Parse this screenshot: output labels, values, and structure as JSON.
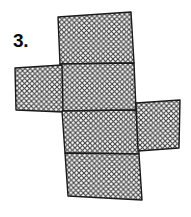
{
  "page": {
    "width": 191,
    "height": 217,
    "background_color": "#ffffff"
  },
  "label": {
    "problem_number": "3."
  },
  "figure": {
    "name": "cube-net-crosshatched",
    "stroke_color": "#1a1a1a",
    "stroke_width": 1.4,
    "fill_color": "#ffffff",
    "hatch": {
      "style": "crosshatch",
      "color": "#3a3a3a",
      "spacing": 5,
      "line_width": 1,
      "angles": [
        45,
        -45
      ]
    },
    "faces": [
      {
        "name": "face-top",
        "points": "58,17 131,12 134,63 60,64"
      },
      {
        "name": "face-upper-middle",
        "points": "60,64 134,63 136,110 62,111"
      },
      {
        "name": "face-left",
        "points": "15,68 62,65 63,112 16,110"
      },
      {
        "name": "face-lower-middle",
        "points": "62,111 136,110 139,154 65,153"
      },
      {
        "name": "face-right",
        "points": "136,103 180,100 179,148 138,151"
      },
      {
        "name": "face-bottom",
        "points": "65,153 139,154 142,200 68,196"
      }
    ]
  }
}
